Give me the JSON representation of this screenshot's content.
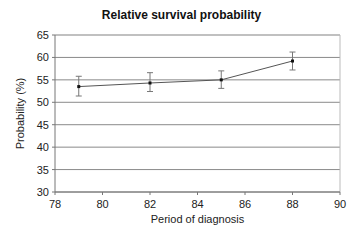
{
  "chart_data": {
    "type": "line",
    "title": "Relative survival probability",
    "xlabel": "Period of diagnosis",
    "ylabel": "Probability (%)",
    "xlim": [
      78,
      90
    ],
    "ylim": [
      30,
      65
    ],
    "xticks": [
      78,
      80,
      82,
      84,
      86,
      88,
      90
    ],
    "yticks": [
      30,
      35,
      40,
      45,
      50,
      55,
      60,
      65
    ],
    "grid": "horizontal",
    "legend": "none",
    "series": [
      {
        "name": "Relative survival",
        "x": [
          79,
          82,
          85,
          88
        ],
        "values": [
          53.5,
          54.3,
          55.0,
          59.2
        ],
        "error_low": [
          51.4,
          52.4,
          53.1,
          57.2
        ],
        "error_high": [
          55.8,
          56.6,
          57.0,
          61.2
        ]
      }
    ]
  }
}
